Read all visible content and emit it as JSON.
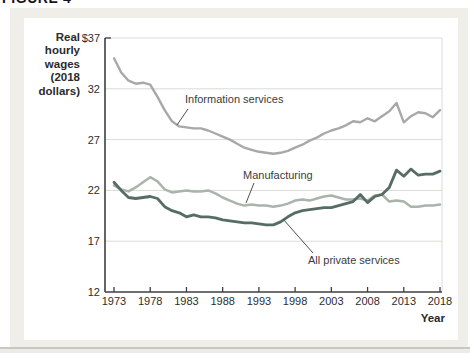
{
  "figure": {
    "header_label": "FIGURE 4",
    "y_axis_title_lines": [
      "Real",
      "hourly",
      "wages",
      "(2018",
      "dollars)"
    ],
    "x_axis_title": "Year"
  },
  "chart_data": {
    "type": "line",
    "title": "",
    "ylabel": "Real hourly wages (2018 dollars)",
    "xlabel": "Year",
    "ylim": [
      12,
      37
    ],
    "xlim": [
      1973,
      2018
    ],
    "grid": "horizontal",
    "legend_position": "inline-annotations",
    "y_ticks": [
      {
        "label": "$37",
        "value": 37
      },
      {
        "label": "32",
        "value": 32
      },
      {
        "label": "27",
        "value": 27
      },
      {
        "label": "22",
        "value": 22
      },
      {
        "label": "17",
        "value": 17
      },
      {
        "label": "12",
        "value": 12
      }
    ],
    "x_ticks": [
      1973,
      1978,
      1983,
      1988,
      1993,
      1998,
      2003,
      2008,
      2013,
      2018
    ],
    "y_gridlines": [
      32,
      27,
      22,
      17
    ],
    "x": [
      1973,
      1974,
      1975,
      1976,
      1977,
      1978,
      1979,
      1980,
      1981,
      1982,
      1983,
      1984,
      1985,
      1986,
      1987,
      1988,
      1989,
      1990,
      1991,
      1992,
      1993,
      1994,
      1995,
      1996,
      1997,
      1998,
      1999,
      2000,
      2001,
      2002,
      2003,
      2004,
      2005,
      2006,
      2007,
      2008,
      2009,
      2010,
      2011,
      2012,
      2013,
      2014,
      2015,
      2016,
      2017,
      2018
    ],
    "series": [
      {
        "name": "Information services",
        "color": "#a8a8a8",
        "stroke_width": 2.4,
        "values": [
          35.0,
          33.6,
          32.8,
          32.5,
          32.6,
          32.4,
          31.2,
          29.9,
          28.8,
          28.3,
          28.2,
          28.1,
          28.1,
          27.9,
          27.6,
          27.3,
          27.0,
          26.6,
          26.2,
          26.0,
          25.8,
          25.7,
          25.6,
          25.7,
          25.9,
          26.2,
          26.5,
          26.9,
          27.2,
          27.6,
          27.9,
          28.1,
          28.4,
          28.8,
          28.7,
          29.1,
          28.8,
          29.3,
          29.8,
          30.6,
          28.7,
          29.3,
          29.7,
          29.6,
          29.2,
          29.9
        ]
      },
      {
        "name": "Manufacturing",
        "color": "#a9b4ab",
        "stroke_width": 2.5,
        "values": [
          22.5,
          22.1,
          21.9,
          22.3,
          22.8,
          23.3,
          22.9,
          22.1,
          21.8,
          21.9,
          22.0,
          21.9,
          21.9,
          22.0,
          21.7,
          21.3,
          21.0,
          20.7,
          20.5,
          20.6,
          20.5,
          20.5,
          20.4,
          20.5,
          20.7,
          21.0,
          21.1,
          21.0,
          21.2,
          21.4,
          21.5,
          21.3,
          21.1,
          21.1,
          21.2,
          21.0,
          21.5,
          21.6,
          20.9,
          21.0,
          20.9,
          20.4,
          20.4,
          20.5,
          20.5,
          20.6
        ]
      },
      {
        "name": "All private services",
        "color": "#566c64",
        "stroke_width": 2.8,
        "values": [
          22.8,
          22.0,
          21.3,
          21.2,
          21.3,
          21.4,
          21.2,
          20.4,
          20.0,
          19.8,
          19.4,
          19.6,
          19.4,
          19.4,
          19.3,
          19.1,
          19.0,
          18.9,
          18.8,
          18.8,
          18.7,
          18.6,
          18.6,
          18.9,
          19.4,
          19.8,
          20.0,
          20.1,
          20.2,
          20.3,
          20.3,
          20.5,
          20.7,
          20.9,
          21.6,
          20.8,
          21.4,
          21.6,
          22.3,
          24.0,
          23.4,
          24.1,
          23.5,
          23.6,
          23.6,
          23.9
        ]
      }
    ],
    "annotations": [
      {
        "text": "Information services",
        "tx": 185,
        "ty": 103,
        "leader": [
          188,
          109,
          177,
          125
        ]
      },
      {
        "text": "Manufacturing",
        "tx": 243,
        "ty": 179,
        "leader": [
          254,
          183,
          246,
          203
        ]
      },
      {
        "text": "All private services",
        "tx": 308,
        "ty": 264,
        "leader": [
          313,
          253,
          283,
          219
        ]
      }
    ],
    "colors": {
      "axis": "#3f3f3f",
      "grid": "#d7ddd5",
      "tick_text": "#2e2e2e",
      "annotation_text": "#3c3c3c",
      "leader": "#4f4f4f"
    }
  }
}
